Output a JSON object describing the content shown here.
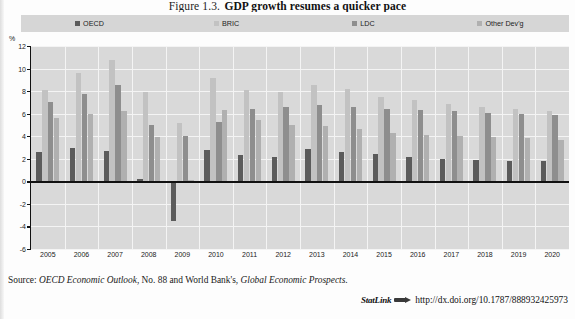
{
  "figure": {
    "label": "Figure 1.3.",
    "title": "GDP growth resumes a quicker pace",
    "axis_unit": "%"
  },
  "legend": {
    "position": "top",
    "items": [
      {
        "label": "OECD",
        "color": "#5b5b5b",
        "swatch": "legend-swatch-oecd"
      },
      {
        "label": "BRIC",
        "color": "#c2c2c2",
        "swatch": "legend-swatch-bric"
      },
      {
        "label": "LDC",
        "color": "#8e8e8e",
        "swatch": "legend-swatch-ldc"
      },
      {
        "label": "Other Dev'g",
        "color": "#b0b0b0",
        "swatch": "legend-swatch-otherdevg"
      }
    ]
  },
  "source": {
    "prefix": "Source:",
    "text_1": "OECD Economic Outlook",
    "text_2": ", No. 88 and World Bank's, ",
    "text_3": "Global Economic Prospects",
    "text_4": "."
  },
  "statlink": {
    "label": "StatLink",
    "icon": "arrow-link-icon",
    "url": "http://dx.doi.org/10.1787/888932425973"
  },
  "chart_data": {
    "type": "bar",
    "title": "GDP growth resumes a quicker pace",
    "xlabel": "",
    "ylabel": "%",
    "ylim": [
      -6,
      12
    ],
    "yticks": [
      12,
      10,
      8,
      6,
      4,
      2,
      0,
      -2,
      -4,
      -6
    ],
    "grid": true,
    "legend_position": "top",
    "categories": [
      "2005",
      "2006",
      "2007",
      "2008",
      "2009",
      "2010",
      "2011",
      "2012",
      "2013",
      "2014",
      "2015",
      "2016",
      "2017",
      "2018",
      "2019",
      "2020"
    ],
    "series": [
      {
        "name": "OECD",
        "color": "#5b5b5b",
        "values": [
          2.6,
          3.0,
          2.7,
          0.2,
          -3.5,
          2.8,
          2.3,
          2.2,
          2.9,
          2.6,
          2.4,
          2.2,
          2.0,
          1.9,
          1.8,
          1.8
        ]
      },
      {
        "name": "BRIC",
        "color": "#c2c2c2",
        "values": [
          8.1,
          9.6,
          10.8,
          7.9,
          5.2,
          9.2,
          8.1,
          7.9,
          8.5,
          8.2,
          7.5,
          7.2,
          6.9,
          6.6,
          6.4,
          6.2
        ]
      },
      {
        "name": "LDC",
        "color": "#8e8e8e",
        "values": [
          7.0,
          7.7,
          8.5,
          5.0,
          4.0,
          5.3,
          6.4,
          6.6,
          6.8,
          6.6,
          6.4,
          6.3,
          6.2,
          6.1,
          6.0,
          5.9
        ]
      },
      {
        "name": "Other Dev'g",
        "color": "#b0b0b0",
        "values": [
          5.6,
          6.0,
          6.2,
          3.9,
          0.1,
          6.3,
          5.4,
          5.0,
          4.9,
          4.6,
          4.3,
          4.1,
          4.0,
          3.9,
          3.8,
          3.7
        ]
      }
    ]
  }
}
